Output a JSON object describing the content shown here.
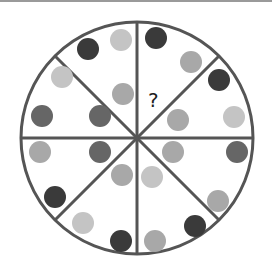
{
  "puzzle": {
    "title": "",
    "question_mark": "?",
    "circle": {
      "cx": 137,
      "cy": 138,
      "r": 116,
      "stroke": "#555555"
    },
    "colors": {
      "dark": "#3a3a3a",
      "darkmid": "#666666",
      "mid": "#8f8f8f",
      "midlight": "#a8a8a8",
      "light": "#c4c4c4"
    },
    "sectors": [
      {
        "id": "n-ne",
        "dots": [
          {
            "x": 156,
            "y": 38,
            "tone": "dark"
          },
          {
            "x": 191,
            "y": 62,
            "tone": "midlight"
          }
        ],
        "missing": {
          "x": 155,
          "y": 100
        }
      },
      {
        "id": "ne-e",
        "dots": [
          {
            "x": 219,
            "y": 80,
            "tone": "dark"
          },
          {
            "x": 234,
            "y": 117,
            "tone": "light"
          },
          {
            "x": 178,
            "y": 120,
            "tone": "midlight"
          }
        ]
      },
      {
        "id": "e-se",
        "dots": [
          {
            "x": 237,
            "y": 152,
            "tone": "darkmid"
          },
          {
            "x": 218,
            "y": 201,
            "tone": "midlight"
          },
          {
            "x": 173,
            "y": 152,
            "tone": "midlight"
          }
        ]
      },
      {
        "id": "se-s",
        "dots": [
          {
            "x": 152,
            "y": 177,
            "tone": "light"
          },
          {
            "x": 195,
            "y": 226,
            "tone": "dark"
          },
          {
            "x": 155,
            "y": 241,
            "tone": "midlight"
          }
        ]
      },
      {
        "id": "s-sw",
        "dots": [
          {
            "x": 122,
            "y": 175,
            "tone": "midlight"
          },
          {
            "x": 83,
            "y": 223,
            "tone": "light"
          },
          {
            "x": 121,
            "y": 241,
            "tone": "dark"
          }
        ]
      },
      {
        "id": "sw-w",
        "dots": [
          {
            "x": 40,
            "y": 152,
            "tone": "midlight"
          },
          {
            "x": 55,
            "y": 197,
            "tone": "dark"
          },
          {
            "x": 100,
            "y": 152,
            "tone": "darkmid"
          }
        ]
      },
      {
        "id": "w-nw",
        "dots": [
          {
            "x": 62,
            "y": 77,
            "tone": "light"
          },
          {
            "x": 42,
            "y": 116,
            "tone": "darkmid"
          },
          {
            "x": 100,
            "y": 116,
            "tone": "darkmid"
          }
        ]
      },
      {
        "id": "nw-n",
        "dots": [
          {
            "x": 88,
            "y": 49,
            "tone": "dark"
          },
          {
            "x": 121,
            "y": 40,
            "tone": "light"
          },
          {
            "x": 123,
            "y": 94,
            "tone": "midlight"
          }
        ]
      }
    ]
  }
}
